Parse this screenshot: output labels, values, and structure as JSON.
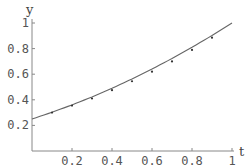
{
  "chart_data": {
    "type": "line",
    "title": "",
    "xlabel": "t",
    "ylabel": "y",
    "xlim": [
      0,
      1
    ],
    "ylim": [
      0,
      1
    ],
    "x_ticks": [
      0.2,
      0.4,
      0.6,
      0.8,
      1
    ],
    "x_tick_labels": [
      "0.2",
      "0.4",
      "0.6",
      "0.8",
      "1"
    ],
    "y_ticks": [
      0.2,
      0.4,
      0.6,
      0.8,
      1
    ],
    "y_tick_labels": [
      "0.2",
      "0.4",
      "0.6",
      "0.8",
      "1"
    ],
    "grid": false,
    "legend": null,
    "series": [
      {
        "name": "curve",
        "style": "line",
        "x": [
          0,
          0.1,
          0.2,
          0.3,
          0.4,
          0.5,
          0.6,
          0.7,
          0.8,
          0.9,
          1.0
        ],
        "values": [
          0.25,
          0.3025,
          0.36,
          0.4225,
          0.49,
          0.5625,
          0.64,
          0.7225,
          0.81,
          0.9025,
          1.0
        ]
      },
      {
        "name": "data points",
        "style": "scatter",
        "x": [
          0.1,
          0.2,
          0.3,
          0.4,
          0.5,
          0.6,
          0.7,
          0.8,
          0.9
        ],
        "values": [
          0.3,
          0.355,
          0.41,
          0.475,
          0.545,
          0.62,
          0.7,
          0.79,
          0.885
        ]
      }
    ]
  },
  "colors": {
    "axis": "#888888",
    "curve": "#666666",
    "points": "#333333",
    "text": "#555555"
  }
}
